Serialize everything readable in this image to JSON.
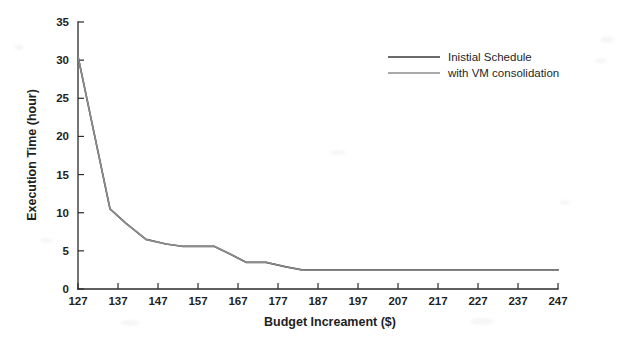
{
  "chart_data": {
    "type": "line",
    "title": "",
    "xlabel": "Budget Increament ($)",
    "ylabel": "Execution Time (hour)",
    "xlim": [
      127,
      247
    ],
    "ylim": [
      0,
      35
    ],
    "xticks": [
      127,
      137,
      147,
      157,
      167,
      177,
      187,
      197,
      207,
      217,
      227,
      237,
      247
    ],
    "yticks": [
      0,
      5,
      10,
      15,
      20,
      25,
      30,
      35
    ],
    "grid": false,
    "legend_position": "top-right",
    "x": [
      127,
      135,
      139,
      144,
      149,
      153,
      158,
      161,
      165,
      169,
      174,
      179,
      183,
      187,
      197,
      207,
      217,
      227,
      237,
      247
    ],
    "series": [
      {
        "name": "Inistial Schedule",
        "style": "solid",
        "color": "#3a3a3a",
        "values": [
          30.5,
          10.5,
          8.6,
          6.5,
          5.9,
          5.6,
          5.6,
          5.6,
          4.6,
          3.5,
          3.5,
          2.9,
          2.5,
          2.5,
          2.5,
          2.5,
          2.5,
          2.5,
          2.5,
          2.5
        ]
      },
      {
        "name": "with VM consolidation",
        "style": "solid-light",
        "color": "#8d8d8d",
        "values": [
          30.5,
          10.5,
          8.6,
          6.5,
          5.9,
          5.6,
          5.6,
          5.6,
          4.6,
          3.5,
          3.5,
          2.9,
          2.5,
          2.5,
          2.5,
          2.5,
          2.5,
          2.5,
          2.5,
          2.5
        ]
      }
    ]
  },
  "legend": {
    "items": [
      {
        "label": "Inistial Schedule",
        "swatch": "solid-dark-line"
      },
      {
        "label": "with VM consolidation",
        "swatch": "solid-light-line"
      }
    ]
  },
  "axes": {
    "x_label": "Budget Increament ($)",
    "y_label": "Execution Time (hour)",
    "x_tick_labels": [
      "127",
      "137",
      "147",
      "157",
      "167",
      "177",
      "187",
      "197",
      "207",
      "217",
      "227",
      "237",
      "247"
    ],
    "y_tick_labels": [
      "0",
      "5",
      "10",
      "15",
      "20",
      "25",
      "30",
      "35"
    ]
  }
}
